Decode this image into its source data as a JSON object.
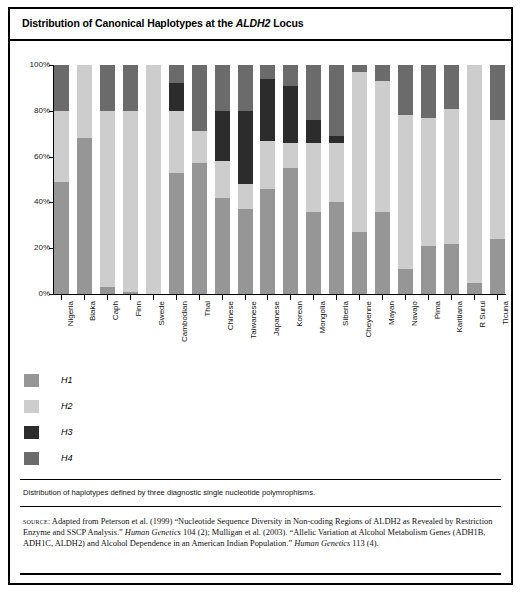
{
  "figure": {
    "title_prefix": "Distribution of Canonical Haplotypes at the ",
    "title_italic": "ALDH2",
    "title_suffix": " Locus",
    "caption": "Distribution of haplotypes defined by three diagnostic single nucleotide polymrophisms.",
    "source_label": "source",
    "source_text_1": ": Adapted from Peterson et al. (1999) “Nucleotide Sequence Diversity in Non-coding Regions of ALDH2 as Revealed by Restriction Enzyme and SSCP Analysis.” ",
    "source_journal_1": "Human Genetics",
    "source_text_2": " 104 (2); Mulligan et al. (2003). “Allelic Variation at Alcohol Metabolism Genes (ADH1B, ADH1C, ALDH2) and Alcohol Dependence in an American Indian Population.” ",
    "source_journal_2": "Human Genetics",
    "source_text_3": " 113 (4)."
  },
  "colors": {
    "H1": "#969696",
    "H2": "#cdcdcd",
    "H3": "#2c2c2c",
    "H4": "#6b6b6b",
    "axis": "#000000",
    "background": "#ffffff"
  },
  "chart_data": {
    "type": "bar",
    "subtype": "stacked-percentage",
    "title": "Distribution of Canonical Haplotypes at the ALDH2 Locus",
    "xlabel": "",
    "ylabel": "",
    "ylim": [
      0,
      100
    ],
    "yticks": [
      "0%",
      "20%",
      "40%",
      "60%",
      "80%",
      "100%"
    ],
    "ytick_values": [
      0,
      20,
      40,
      60,
      80,
      100
    ],
    "grid": false,
    "legend_position": "below-left",
    "legend": [
      "H1",
      "H2",
      "H3",
      "H4"
    ],
    "categories": [
      "Nigeria",
      "Biaka",
      "Caph",
      "Finn",
      "Swede",
      "Cambodian",
      "Thai",
      "Chinese",
      "Taiwanese",
      "Japanese",
      "Korean",
      "Mongolia",
      "Siberia",
      "Cheyenne",
      "Mayan",
      "Navajo",
      "Pima",
      "Karitiana",
      "R Surui",
      "Ticuna"
    ],
    "series": [
      {
        "name": "H1",
        "values": [
          49,
          68,
          3,
          1,
          0,
          53,
          57,
          42,
          37,
          46,
          55,
          36,
          40,
          27,
          36,
          11,
          21,
          22,
          5,
          24
        ]
      },
      {
        "name": "H2",
        "values": [
          31,
          32,
          77,
          79,
          100,
          27,
          14,
          16,
          11,
          21,
          11,
          30,
          26,
          70,
          57,
          67,
          56,
          59,
          95,
          52
        ]
      },
      {
        "name": "H3",
        "values": [
          0,
          0,
          0,
          0,
          0,
          12,
          0,
          22,
          32,
          27,
          25,
          10,
          3,
          0,
          0,
          0,
          0,
          0,
          0,
          0
        ]
      },
      {
        "name": "H4",
        "values": [
          20,
          0,
          20,
          20,
          0,
          8,
          29,
          20,
          20,
          6,
          9,
          24,
          31,
          3,
          7,
          22,
          23,
          19,
          0,
          24
        ]
      }
    ]
  }
}
